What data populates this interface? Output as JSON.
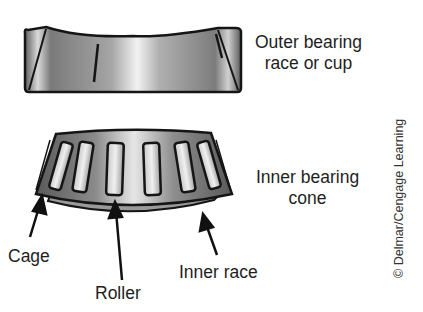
{
  "labels": {
    "outer_race": [
      "Outer bearing",
      "race or cup"
    ],
    "inner_cone": [
      "Inner bearing",
      "cone"
    ],
    "cage": "Cage",
    "roller": "Roller",
    "inner_race": "Inner race"
  },
  "credit": "© Delmar/Cengage Learning",
  "colors": {
    "metal_dark": "#6e6e6e",
    "metal_light": "#e8e8e8",
    "outline": "#151515"
  }
}
